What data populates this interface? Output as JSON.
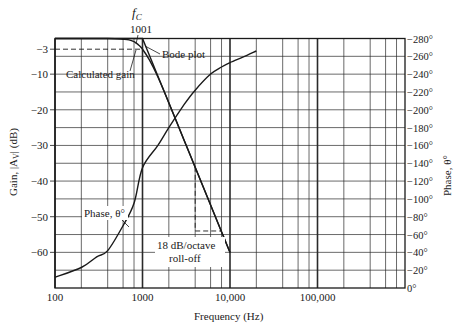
{
  "chart_data": {
    "type": "line",
    "title": "",
    "xlabel": "Frequency (Hz)",
    "ylabel": "Gain, |A_V| (dB)",
    "ylabel_right": "Phase, θ°",
    "x_scale": "log",
    "xlim": [
      100,
      1000000
    ],
    "ylim": [
      -70,
      0
    ],
    "ylim_right": [
      0,
      280
    ],
    "grid": true,
    "x_ticks": [
      {
        "value": 100,
        "label": "100"
      },
      {
        "value": 1000,
        "label": "1000"
      },
      {
        "value": 10000,
        "label": "10,000"
      },
      {
        "value": 100000,
        "label": "100,000"
      }
    ],
    "y_ticks": [
      {
        "value": -3,
        "label": "−3"
      },
      {
        "value": -10,
        "label": "−10"
      },
      {
        "value": -20,
        "label": "−20"
      },
      {
        "value": -30,
        "label": "−30"
      },
      {
        "value": -40,
        "label": "−40"
      },
      {
        "value": -50,
        "label": "−50"
      },
      {
        "value": -60,
        "label": "−60"
      }
    ],
    "y_ticks_right": [
      {
        "value": 280,
        "label": "−280°"
      },
      {
        "value": 260,
        "label": "−260°"
      },
      {
        "value": 240,
        "label": "−240°"
      },
      {
        "value": 220,
        "label": "−220°"
      },
      {
        "value": 200,
        "label": "−200°"
      },
      {
        "value": 180,
        "label": "−180°"
      },
      {
        "value": 160,
        "label": "−160°"
      },
      {
        "value": 140,
        "label": "−140°"
      },
      {
        "value": 120,
        "label": "−120°"
      },
      {
        "value": 100,
        "label": "−100°"
      },
      {
        "value": 80,
        "label": "−80°"
      },
      {
        "value": 60,
        "label": "−60°"
      },
      {
        "value": 40,
        "label": "−40°"
      },
      {
        "value": 20,
        "label": "−20°"
      },
      {
        "value": 0,
        "label": "0°"
      }
    ],
    "series": [
      {
        "name": "Bode plot",
        "axis": "left",
        "x": [
          100,
          1000,
          10000
        ],
        "values": [
          0,
          0,
          -60
        ]
      },
      {
        "name": "Calculated gain",
        "axis": "left",
        "x": [
          100,
          400,
          600,
          700,
          800,
          900,
          1000,
          1200,
          1500,
          2000,
          3000,
          4000,
          6000,
          8000,
          10000
        ],
        "values": [
          0,
          0,
          -0.2,
          -0.4,
          -0.9,
          -1.8,
          -3,
          -6,
          -10.8,
          -18,
          -28.6,
          -36.1,
          -46.7,
          -54.2,
          -60
        ]
      },
      {
        "name": "Phase, θ°",
        "axis": "right",
        "x": [
          100,
          200,
          300,
          400,
          600,
          800,
          1000,
          1500,
          2000,
          3000,
          4000,
          6000,
          8000,
          10000,
          14000,
          20000
        ],
        "values": [
          12,
          23,
          35,
          42,
          70,
          95,
          135,
          160,
          180,
          206,
          222,
          240,
          248,
          253,
          259,
          266
        ]
      }
    ],
    "annotations": [
      {
        "text": "f",
        "sub": "C",
        "x": 1001,
        "note": "cutoff frequency label"
      },
      {
        "text": "1001",
        "x": 1001
      },
      {
        "text": "Calculated gain"
      },
      {
        "text": "Bode plot"
      },
      {
        "text": "Phase, θ°"
      },
      {
        "text": "18 dB/octave"
      },
      {
        "text": "roll-off"
      }
    ],
    "reference_lines": [
      {
        "type": "dashed",
        "desc": "−3 dB level",
        "from": [
          100,
          -3
        ],
        "to": [
          1000,
          -3
        ]
      },
      {
        "type": "dashed",
        "desc": "octave step vertical",
        "from": [
          4000,
          -36
        ],
        "to": [
          4000,
          -54
        ]
      },
      {
        "type": "dashed",
        "desc": "octave step horizontal",
        "from": [
          4000,
          -54
        ],
        "to": [
          8000,
          -54
        ]
      }
    ]
  },
  "labels": {
    "fc_main": "f",
    "fc_sub": "C",
    "fc_value": "1001",
    "calc_gain": "Calculated gain",
    "bode_plot": "Bode plot",
    "phase": "Phase, θ°",
    "rolloff_1": "18 dB/octave",
    "rolloff_2": "roll-off",
    "xlabel": "Frequency (Hz)",
    "ylabel_left": "Gain, |A",
    "ylabel_left_sub": "V",
    "ylabel_left_end": "| (dB)",
    "ylabel_right": "Phase, θ°"
  },
  "style": {
    "line_color": "#1a1a1a",
    "grid_color": "#2a2a2a",
    "background": "#ffffff"
  }
}
